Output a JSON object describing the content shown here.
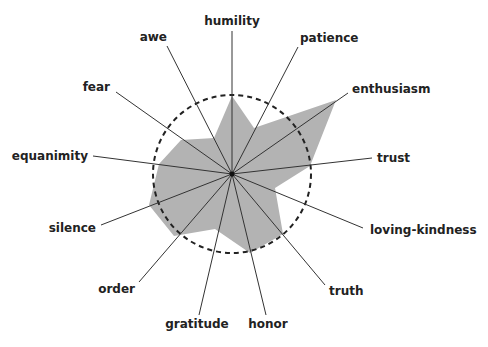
{
  "chart_data": {
    "type": "radar",
    "title": "",
    "center": [
      232,
      174
    ],
    "reference_radius_px": 79,
    "reference_circle": {
      "value": 1.0,
      "style": "dashed",
      "color": "#222222"
    },
    "fill_color": "#b3b3b3",
    "spoke_color": "#333333",
    "categories": [
      "humility",
      "patience",
      "enthusiasm",
      "trust",
      "loving-kindness",
      "truth",
      "honor",
      "gratitude",
      "order",
      "silence",
      "equanimity",
      "fear",
      "awe"
    ],
    "values": [
      1.0,
      0.65,
      1.62,
      0.99,
      0.57,
      1.0,
      1.0,
      0.73,
      1.07,
      1.12,
      0.93,
      0.78,
      0.51
    ],
    "spokes": [
      {
        "label": "humility",
        "end": [
          232,
          31
        ],
        "label_pos": [
          232,
          25
        ],
        "anchor": "middle"
      },
      {
        "label": "patience",
        "end": [
          298,
          47
        ],
        "label_pos": [
          300,
          42
        ],
        "anchor": "start"
      },
      {
        "label": "enthusiasm",
        "end": [
          348,
          93
        ],
        "label_pos": [
          352,
          93
        ],
        "anchor": "start"
      },
      {
        "label": "trust",
        "end": [
          372,
          158
        ],
        "label_pos": [
          377,
          162
        ],
        "anchor": "start"
      },
      {
        "label": "loving-kindness",
        "end": [
          363,
          228
        ],
        "label_pos": [
          370,
          234
        ],
        "anchor": "start"
      },
      {
        "label": "truth",
        "end": [
          325,
          285
        ],
        "label_pos": [
          329,
          295
        ],
        "anchor": "start"
      },
      {
        "label": "honor",
        "end": [
          266,
          315
        ],
        "label_pos": [
          268,
          328
        ],
        "anchor": "middle"
      },
      {
        "label": "gratitude",
        "end": [
          199,
          315
        ],
        "label_pos": [
          197,
          328
        ],
        "anchor": "middle"
      },
      {
        "label": "order",
        "end": [
          139,
          282
        ],
        "label_pos": [
          135,
          293
        ],
        "anchor": "end"
      },
      {
        "label": "silence",
        "end": [
          101,
          225
        ],
        "label_pos": [
          96,
          232
        ],
        "anchor": "end"
      },
      {
        "label": "equanimity",
        "end": [
          93,
          156
        ],
        "label_pos": [
          88,
          160
        ],
        "anchor": "end"
      },
      {
        "label": "fear",
        "end": [
          116,
          92
        ],
        "label_pos": [
          110,
          91
        ],
        "anchor": "end"
      },
      {
        "label": "awe",
        "end": [
          167,
          46
        ],
        "label_pos": [
          167,
          41
        ],
        "anchor": "end"
      }
    ],
    "polygon": [
      [
        232,
        96
      ],
      [
        254,
        128
      ],
      [
        336,
        100
      ],
      [
        310,
        166
      ],
      [
        275,
        188
      ],
      [
        283,
        234
      ],
      [
        250,
        253
      ],
      [
        215,
        229
      ],
      [
        174,
        236
      ],
      [
        149,
        205
      ],
      [
        159,
        164
      ],
      [
        181,
        140
      ],
      [
        214,
        138
      ]
    ],
    "grid": false,
    "legend": null
  }
}
